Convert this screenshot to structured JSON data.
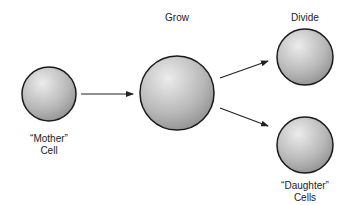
{
  "labels": {
    "grow": "Grow",
    "divide": "Divide",
    "mother_line1": "“Mother”",
    "mother_line2": "Cell",
    "daughter_line1": "“Daughter”",
    "daughter_line2": "Cells"
  },
  "colors": {
    "cell_outline": "#1a1a1a",
    "cell_light": "#e6e6e6",
    "cell_dark": "#8c8c8c",
    "arrow": "#222222"
  }
}
